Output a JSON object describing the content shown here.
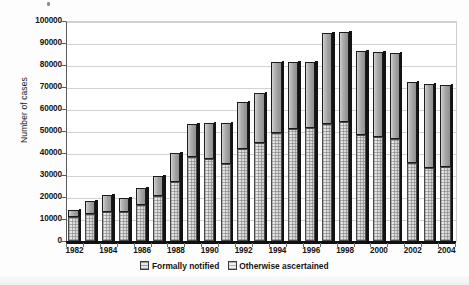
{
  "chart_data": {
    "type": "bar",
    "subtype": "stacked-vertical",
    "title": "",
    "xlabel": "",
    "ylabel": "Number of cases",
    "ylim": [
      0,
      100000
    ],
    "ytick_step": 10000,
    "grid": true,
    "legend_position": "bottom",
    "categories": [
      "1982",
      "1983",
      "1984",
      "1985",
      "1986",
      "1987",
      "1988",
      "1989",
      "1990",
      "1991",
      "1992",
      "1993",
      "1994",
      "1995",
      "1996",
      "1997",
      "1998",
      "1999",
      "2000",
      "2001",
      "2002",
      "2003",
      "2004"
    ],
    "xtick_labels": [
      "1982",
      "1984",
      "1986",
      "1988",
      "1990",
      "1992",
      "1994",
      "1996",
      "1998",
      "2000",
      "2002",
      "2004"
    ],
    "ytick_labels": [
      "0",
      "10000",
      "20000",
      "30000",
      "40000",
      "50000",
      "60000",
      "70000",
      "80000",
      "90000",
      "100000"
    ],
    "series": [
      {
        "name": "Formally notified",
        "fill": "dotted-light-gray",
        "values": [
          11000,
          12500,
          13000,
          13000,
          16500,
          20500,
          27000,
          38000,
          37500,
          35000,
          42000,
          44500,
          49000,
          51000,
          51500,
          53000,
          54000,
          48000,
          47500,
          46500,
          35500,
          33000,
          33500
        ]
      },
      {
        "name": "Otherwise ascertained",
        "fill": "solid-dark-gray",
        "values": [
          3000,
          5500,
          8000,
          6500,
          7500,
          9000,
          13000,
          15000,
          16000,
          18500,
          21000,
          23000,
          32500,
          30500,
          30000,
          41500,
          41000,
          38500,
          38500,
          39000,
          37000,
          38500,
          37500
        ]
      }
    ],
    "totals": [
      14000,
      18000,
      21000,
      19500,
      24000,
      29500,
      40000,
      53000,
      53500,
      53500,
      63000,
      67500,
      81500,
      81500,
      81500,
      94500,
      95000,
      86500,
      86000,
      85500,
      72500,
      71500,
      71000
    ]
  },
  "legend": {
    "items": [
      {
        "label": "Formally notified",
        "swatch": "series-swatch-formally-notified"
      },
      {
        "label": "Otherwise ascertained",
        "swatch": "series-swatch-otherwise-ascertained"
      }
    ]
  }
}
